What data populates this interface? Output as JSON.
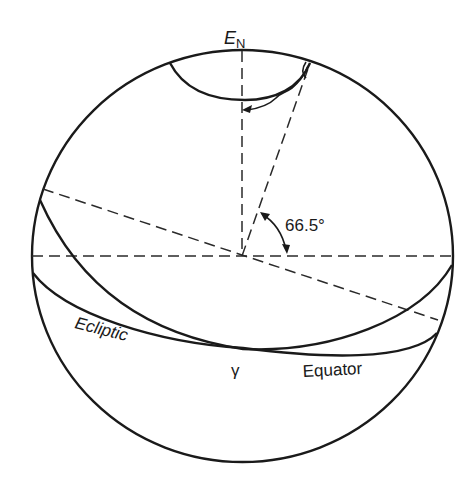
{
  "diagram": {
    "type": "celestial-sphere",
    "labels": {
      "pole": "E",
      "pole_subscript": "N",
      "angle": "66.5°",
      "ecliptic": "Ecliptic",
      "equator": "Equator",
      "vernal_equinox": "γ"
    },
    "colors": {
      "line": "#1a1a1a",
      "background": "#ffffff"
    }
  }
}
